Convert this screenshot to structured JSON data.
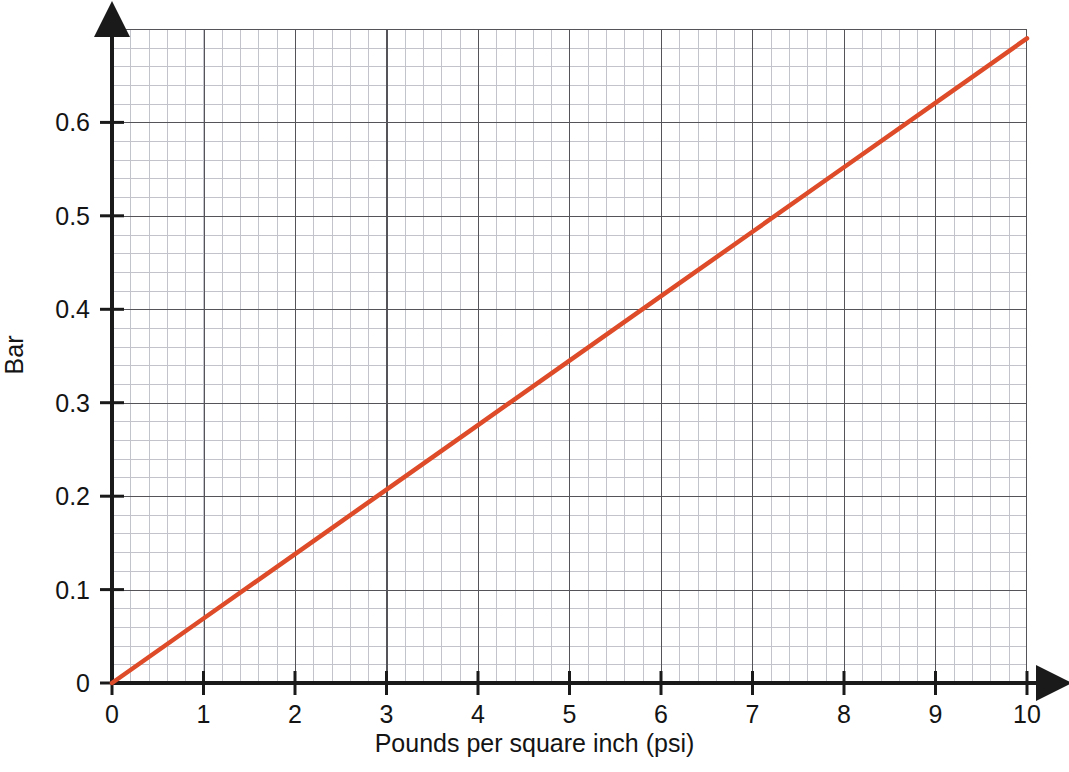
{
  "chart_data": {
    "type": "line",
    "title": "",
    "subtitle": "",
    "xlabel": "Pounds per square inch (psi)",
    "ylabel": "Bar",
    "xlim": [
      0,
      10
    ],
    "ylim": [
      0,
      0.7
    ],
    "xticks": [
      "0",
      "1",
      "2",
      "3",
      "4",
      "5",
      "6",
      "7",
      "8",
      "9",
      "10"
    ],
    "xtick_values": [
      0,
      1,
      2,
      3,
      4,
      5,
      6,
      7,
      8,
      9,
      10
    ],
    "yticks": [
      "0",
      "0.1",
      "0.2",
      "0.3",
      "0.4",
      "0.5",
      "0.6"
    ],
    "ytick_values": [
      0,
      0.1,
      0.2,
      0.3,
      0.4,
      0.5,
      0.6
    ],
    "grid": true,
    "grid_minor": true,
    "legend": false,
    "legend_position": "none",
    "series": [
      {
        "name": "psi to Bar conversion",
        "color": "#de4b28",
        "x": [
          0,
          1,
          2,
          3,
          4,
          5,
          6,
          7,
          8,
          9,
          10
        ],
        "values": [
          0,
          0.069,
          0.138,
          0.207,
          0.276,
          0.345,
          0.414,
          0.483,
          0.552,
          0.621,
          0.69
        ]
      }
    ],
    "annotations": []
  },
  "axes": {
    "y_title": "Bar",
    "x_title": "Pounds per square inch (psi)"
  },
  "colors": {
    "line": "#de4b28",
    "major_grid": "#545459",
    "minor_grid": "#b9b9c4",
    "axis": "#1a1a1a",
    "text": "#141414",
    "background": "#ffffff"
  }
}
